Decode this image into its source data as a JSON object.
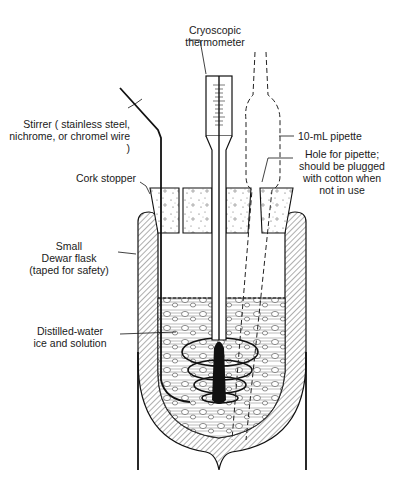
{
  "title_fragment": "...",
  "labels": {
    "thermometer": "Cryoscopic\nthermometer",
    "stirrer": "Stirrer ( stainless steel,\nnichrome, or chromel wire )",
    "pipette": "10-mL  pipette",
    "cork": "Cork stopper",
    "hole": "Hole for pipette;\nshould be plugged\nwith cotton when\nnot in use",
    "dewar": "Small\nDewar flask\n(taped for safety)",
    "ice": "Distilled-water\nice and solution"
  },
  "colors": {
    "ink": "#1a1a1a",
    "background": "#ffffff"
  }
}
